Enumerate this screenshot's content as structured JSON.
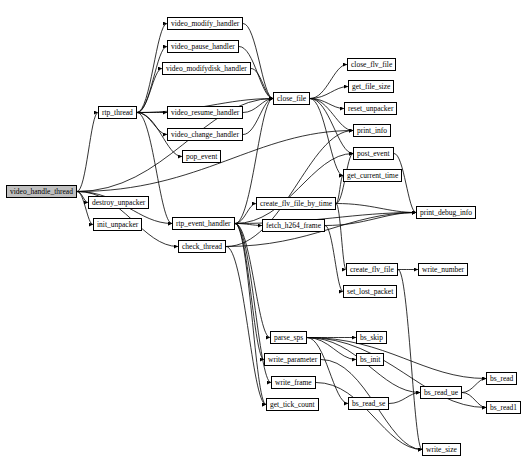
{
  "diagram": {
    "type": "call-graph",
    "root": "video_handle_thread",
    "nodes": [
      {
        "id": "video_handle_thread",
        "label": "video_handle_thread",
        "x": 6,
        "y": 185,
        "w": 62,
        "root": true
      },
      {
        "id": "destroy_unpacker",
        "label": "destroy_unpacker",
        "x": 88,
        "y": 196,
        "w": 52
      },
      {
        "id": "init_unpacker",
        "label": "init_unpacker",
        "x": 93,
        "y": 218,
        "w": 42
      },
      {
        "id": "rtp_thread",
        "label": "rtp_thread",
        "x": 98,
        "y": 106,
        "w": 34
      },
      {
        "id": "video_modify_handler",
        "label": "video_modify_handler",
        "x": 167,
        "y": 17,
        "w": 64
      },
      {
        "id": "video_pause_handler",
        "label": "video_pause_handler",
        "x": 167,
        "y": 40,
        "w": 63
      },
      {
        "id": "video_modifydisk_handler",
        "label": "video_modifydisk_handler",
        "x": 162,
        "y": 62,
        "w": 74
      },
      {
        "id": "video_resume_handler",
        "label": "video_resume_handler",
        "x": 167,
        "y": 106,
        "w": 64
      },
      {
        "id": "video_change_handler",
        "label": "video_change_handler",
        "x": 167,
        "y": 128,
        "w": 64
      },
      {
        "id": "pop_event",
        "label": "pop_event",
        "x": 182,
        "y": 150,
        "w": 34
      },
      {
        "id": "close_file",
        "label": "close_file",
        "x": 273,
        "y": 92,
        "w": 34
      },
      {
        "id": "close_flv_file",
        "label": "close_flv_file",
        "x": 347,
        "y": 58,
        "w": 42
      },
      {
        "id": "get_file_size",
        "label": "get_file_size",
        "x": 348,
        "y": 80,
        "w": 40
      },
      {
        "id": "reset_unpacker",
        "label": "reset_unpacker",
        "x": 344,
        "y": 102,
        "w": 48
      },
      {
        "id": "print_info",
        "label": "print_info",
        "x": 353,
        "y": 124,
        "w": 31
      },
      {
        "id": "post_event",
        "label": "post_event",
        "x": 353,
        "y": 147,
        "w": 33
      },
      {
        "id": "get_current_time",
        "label": "get_current_time",
        "x": 343,
        "y": 169,
        "w": 52
      },
      {
        "id": "print_debug_info",
        "label": "print_debug_info",
        "x": 416,
        "y": 206,
        "w": 49
      },
      {
        "id": "rtp_event_handler",
        "label": "rtp_event_handler",
        "x": 172,
        "y": 217,
        "w": 55
      },
      {
        "id": "check_thread",
        "label": "check_thread",
        "x": 178,
        "y": 240,
        "w": 43
      },
      {
        "id": "create_flv_file_by_time",
        "label": "create_flv_file_by_time",
        "x": 256,
        "y": 197,
        "w": 66
      },
      {
        "id": "fetch_h264_frame",
        "label": "fetch_h264_frame",
        "x": 262,
        "y": 219,
        "w": 54
      },
      {
        "id": "create_flv_file",
        "label": "create_flv_file",
        "x": 346,
        "y": 263,
        "w": 42
      },
      {
        "id": "write_number",
        "label": "write_number",
        "x": 418,
        "y": 263,
        "w": 42
      },
      {
        "id": "set_lost_packet",
        "label": "set_lost_packet",
        "x": 343,
        "y": 285,
        "w": 46
      },
      {
        "id": "parse_sps",
        "label": "parse_sps",
        "x": 270,
        "y": 331,
        "w": 32
      },
      {
        "id": "write_parameter",
        "label": "write_parameter",
        "x": 264,
        "y": 353,
        "w": 48
      },
      {
        "id": "write_frame",
        "label": "write_frame",
        "x": 271,
        "y": 376,
        "w": 37
      },
      {
        "id": "get_tick_count",
        "label": "get_tick_count",
        "x": 266,
        "y": 398,
        "w": 44
      },
      {
        "id": "bs_skip",
        "label": "bs_skip",
        "x": 356,
        "y": 331,
        "w": 27
      },
      {
        "id": "bs_init",
        "label": "bs_init",
        "x": 356,
        "y": 353,
        "w": 27
      },
      {
        "id": "bs_read_se",
        "label": "bs_read_se",
        "x": 348,
        "y": 397,
        "w": 40
      },
      {
        "id": "bs_read_ue",
        "label": "bs_read_ue",
        "x": 420,
        "y": 386,
        "w": 38
      },
      {
        "id": "bs_read",
        "label": "bs_read",
        "x": 486,
        "y": 372,
        "w": 28
      },
      {
        "id": "bs_read1",
        "label": "bs_read1",
        "x": 486,
        "y": 401,
        "w": 29
      },
      {
        "id": "write_size",
        "label": "write_size",
        "x": 422,
        "y": 443,
        "w": 34
      }
    ],
    "edges": [
      [
        "video_handle_thread",
        "destroy_unpacker"
      ],
      [
        "video_handle_thread",
        "init_unpacker"
      ],
      [
        "video_handle_thread",
        "rtp_thread"
      ],
      [
        "video_handle_thread",
        "close_file"
      ],
      [
        "video_handle_thread",
        "print_info"
      ],
      [
        "video_handle_thread",
        "check_thread"
      ],
      [
        "video_handle_thread",
        "rtp_event_handler"
      ],
      [
        "rtp_thread",
        "video_modify_handler"
      ],
      [
        "rtp_thread",
        "video_pause_handler"
      ],
      [
        "rtp_thread",
        "video_modifydisk_handler"
      ],
      [
        "rtp_thread",
        "video_resume_handler"
      ],
      [
        "rtp_thread",
        "video_change_handler"
      ],
      [
        "rtp_thread",
        "pop_event"
      ],
      [
        "rtp_thread",
        "close_file"
      ],
      [
        "rtp_thread",
        "rtp_event_handler"
      ],
      [
        "video_modify_handler",
        "close_file"
      ],
      [
        "video_pause_handler",
        "close_file"
      ],
      [
        "video_modifydisk_handler",
        "close_file"
      ],
      [
        "video_resume_handler",
        "close_file"
      ],
      [
        "video_change_handler",
        "close_file"
      ],
      [
        "close_file",
        "close_flv_file"
      ],
      [
        "close_file",
        "get_file_size"
      ],
      [
        "close_file",
        "reset_unpacker"
      ],
      [
        "close_file",
        "print_info"
      ],
      [
        "close_file",
        "post_event"
      ],
      [
        "close_file",
        "get_current_time"
      ],
      [
        "post_event",
        "print_debug_info"
      ],
      [
        "rtp_event_handler",
        "close_file"
      ],
      [
        "rtp_event_handler",
        "create_flv_file_by_time"
      ],
      [
        "rtp_event_handler",
        "fetch_h264_frame"
      ],
      [
        "rtp_event_handler",
        "print_debug_info"
      ],
      [
        "rtp_event_handler",
        "parse_sps"
      ],
      [
        "rtp_event_handler",
        "write_parameter"
      ],
      [
        "rtp_event_handler",
        "write_frame"
      ],
      [
        "rtp_event_handler",
        "get_tick_count"
      ],
      [
        "rtp_event_handler",
        "post_event"
      ],
      [
        "check_thread",
        "print_info"
      ],
      [
        "check_thread",
        "print_debug_info"
      ],
      [
        "check_thread",
        "get_tick_count"
      ],
      [
        "create_flv_file_by_time",
        "get_current_time"
      ],
      [
        "create_flv_file_by_time",
        "print_debug_info"
      ],
      [
        "create_flv_file_by_time",
        "create_flv_file"
      ],
      [
        "create_flv_file_by_time",
        "post_event"
      ],
      [
        "fetch_h264_frame",
        "print_debug_info"
      ],
      [
        "fetch_h264_frame",
        "set_lost_packet"
      ],
      [
        "create_flv_file",
        "write_number"
      ],
      [
        "create_flv_file",
        "write_size"
      ],
      [
        "parse_sps",
        "bs_skip"
      ],
      [
        "parse_sps",
        "bs_init"
      ],
      [
        "parse_sps",
        "bs_read"
      ],
      [
        "parse_sps",
        "bs_read_ue"
      ],
      [
        "parse_sps",
        "bs_read_se"
      ],
      [
        "parse_sps",
        "bs_read1"
      ],
      [
        "bs_read_se",
        "bs_read_ue"
      ],
      [
        "bs_read_ue",
        "bs_read"
      ],
      [
        "bs_read_ue",
        "bs_read1"
      ],
      [
        "write_parameter",
        "write_size"
      ],
      [
        "write_frame",
        "write_size"
      ]
    ]
  }
}
